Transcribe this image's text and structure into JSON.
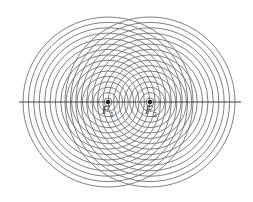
{
  "diagram": {
    "type": "concentric-circles-two-foci",
    "stroke_color": "#707070",
    "axis_color": "#404040",
    "focus_color": "#222222",
    "center_y": 102,
    "axis": {
      "x1": 19,
      "x2": 241
    },
    "radius_start": 4,
    "radius_step": 5.4,
    "circle_count": 16,
    "foci": [
      {
        "id": "F1",
        "x": 108,
        "label": "F",
        "sub": "1",
        "label_x": 102,
        "label_y": 105
      },
      {
        "id": "F2",
        "x": 150,
        "label": "F",
        "sub": "2",
        "label_x": 145,
        "label_y": 105
      }
    ]
  }
}
